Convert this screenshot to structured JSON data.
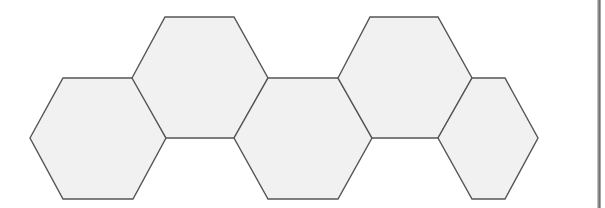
{
  "diagram": {
    "type": "hexagon-tessellation",
    "fill": "#f1f1f1",
    "stroke": "#555555",
    "stroke_width": 1.4,
    "hexagons": [
      {
        "id": "hex-1",
        "points": "30,138 63,78 133,78 166,138 133,199 63,199"
      },
      {
        "id": "hex-2",
        "points": "132,78 165,17 234,17 268,78 234,138 166,138"
      },
      {
        "id": "hex-3",
        "points": "234,138 268,78 338,78 372,138 338,199 268,199"
      },
      {
        "id": "hex-4",
        "points": "338,78 370,17 438,17 472,78 438,138 372,138"
      },
      {
        "id": "hex-5",
        "points": "438,138 472,78 505,78 505,78 538,138 505,199 472,199"
      }
    ]
  },
  "frame": {
    "right_border_color": "#7a7a7a"
  }
}
